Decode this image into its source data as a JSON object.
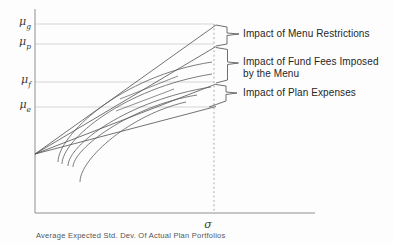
{
  "figure": {
    "y_axis_labels": [
      {
        "base": "μ",
        "sub": "g",
        "y": 24
      },
      {
        "base": "μ",
        "sub": "p",
        "y": 44
      },
      {
        "base": "μ",
        "sub": "f",
        "y": 82
      },
      {
        "base": "μ",
        "sub": "e",
        "y": 107
      }
    ],
    "x_axis_marker": "σ",
    "caption": "Average Expected Std. Dev. Of Actual Plan Portfolios",
    "annotations": [
      {
        "lines": [
          "Impact of Menu Restrictions",
          ""
        ],
        "top": 28
      },
      {
        "lines": [
          "Impact of Fund Fees Imposed",
          "by the Menu"
        ],
        "top": 56
      },
      {
        "lines": [
          "Impact of Plan Expenses",
          ""
        ],
        "top": 87
      }
    ]
  },
  "chart_data": {
    "type": "line",
    "title": "",
    "xlabel": "σ (Average Expected Std. Dev. Of Actual Plan Portfolios)",
    "ylabel": "Expected return levels: μg, μp, μf, μe",
    "legend": "none",
    "grid": "horizontal reference lines at μg, μp, μf, μe; vertical dashed marker at σ",
    "semantics": {
      "gap_mu_g_to_mu_p": "Impact of Menu Restrictions",
      "gap_mu_p_to_mu_f": "Impact of Fund Fees Imposed by the Menu",
      "gap_mu_f_to_mu_e": "Impact of Plan Expenses",
      "straight_lines": "tangent lines fanning from a common origin on the y-axis to μg, μp, μf and μe at σ",
      "curves": "concave efficient-frontier curves rising and flattening toward σ"
    },
    "colors": {
      "background": "#fdfdfd",
      "axis": "#8f8f8f",
      "gridline": "#c3c3c3",
      "dashed": "#929292",
      "tangent_line": "#4f4f4f",
      "curve": "#5c5c5c",
      "bracket": "#4a4a4a",
      "text": "#262626"
    },
    "geometry": {
      "canvas": [
        394,
        243
      ],
      "y_axis": {
        "x": 35,
        "y1": 9,
        "y2": 213
      },
      "x_axis": {
        "y": 213,
        "x1": 35,
        "x2": 315
      },
      "gridline_x1": 35,
      "gridline_x2": 214,
      "gridline_ys": [
        24,
        44,
        82,
        107
      ],
      "dashed_line": {
        "x": 214,
        "y1": 24,
        "y2": 213
      },
      "fan_origin": [
        35,
        154
      ],
      "fan_targets": [
        [
          216,
          25
        ],
        [
          216,
          46.5
        ],
        [
          216,
          84
        ],
        [
          216,
          106.5
        ]
      ],
      "curve_paths": [
        "M58,162 C58,136 120,76 212,62",
        "M62,164 C62,140 124,88 212,74",
        "M68,166 C68,145 128,100 211,87",
        "M73,167 C73,149 130,106 197,95",
        "M80,182 C80,158 132,114 186,102"
      ],
      "segment_lines": [
        [
          120,
          99,
          178,
          76
        ],
        [
          116,
          111,
          174,
          89
        ]
      ],
      "bracket_paths": [
        "M216,25 L227,27 L227,33 L239,34 L227,35.5 L227,44 L216,46",
        "M216,47.5 L227.5,49.5 L227.5,62 L238.5,63 L227.5,64.5 L227.5,80 L216,83",
        "M216,84.5 L226,86 L226,92 L237,93 L226,94.5 L226,101 L209,107"
      ]
    }
  }
}
